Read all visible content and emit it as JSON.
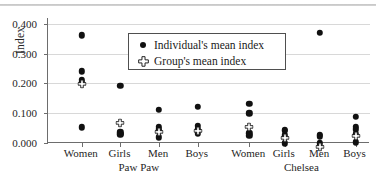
{
  "figure": {
    "y_axis_label": "Index",
    "y_ticks": [
      "0.400",
      "0.300",
      "0.200",
      "0.100",
      "0.000"
    ],
    "legend": {
      "items": [
        {
          "label": "Individual's mean index",
          "marker": "filled-circle-icon"
        },
        {
          "label": "Group's mean index",
          "marker": "open-cross-icon"
        }
      ]
    },
    "group_labels": [
      "Paw Paw",
      "Chelsea"
    ],
    "category_labels": [
      "Women",
      "Girls",
      "Men",
      "Boys",
      "Women",
      "Girls",
      "Men",
      "Boys"
    ],
    "top_rule_text": ""
  },
  "chart_data": {
    "type": "scatter",
    "title": "",
    "xlabel": "",
    "ylabel": "Index",
    "ylim": [
      0.0,
      0.42
    ],
    "yticks": [
      0.0,
      0.1,
      0.2,
      0.3,
      0.4
    ],
    "grid": true,
    "legend_position": "upper-center",
    "groups": [
      "Paw Paw",
      "Chelsea"
    ],
    "categories": [
      "Women",
      "Girls",
      "Men",
      "Boys",
      "Women",
      "Girls",
      "Men",
      "Boys"
    ],
    "series": [
      {
        "name": "Individual's mean index",
        "marker": "filled-circle",
        "points": [
          {
            "category": "Women",
            "group": "Paw Paw",
            "values": [
              0.362,
              0.241,
              0.213,
              0.206,
              0.053
            ]
          },
          {
            "category": "Girls",
            "group": "Paw Paw",
            "values": [
              0.193,
              0.036,
              0.031,
              0.028
            ]
          },
          {
            "category": "Men",
            "group": "Paw Paw",
            "values": [
              0.112,
              0.055,
              0.046,
              0.042,
              0.019
            ]
          },
          {
            "category": "Boys",
            "group": "Paw Paw",
            "values": [
              0.122,
              0.058,
              0.048,
              0.04,
              0.031
            ]
          },
          {
            "category": "Women",
            "group": "Chelsea",
            "values": [
              0.131,
              0.1,
              0.033,
              0.025
            ]
          },
          {
            "category": "Girls",
            "group": "Chelsea",
            "values": [
              0.044,
              0.04,
              0.026,
              -0.001
            ]
          },
          {
            "category": "Men",
            "group": "Chelsea",
            "values": [
              0.37,
              0.028,
              0.022,
              -0.001
            ]
          },
          {
            "category": "Boys",
            "group": "Chelsea",
            "values": [
              0.087,
              0.055,
              0.046,
              0.03,
              0.002
            ]
          }
        ]
      },
      {
        "name": "Group's mean index",
        "marker": "open-cross",
        "points": [
          {
            "category": "Women",
            "group": "Paw Paw",
            "value": 0.215
          },
          {
            "category": "Girls",
            "group": "Paw Paw",
            "value": 0.083
          },
          {
            "category": "Men",
            "group": "Paw Paw",
            "value": 0.055
          },
          {
            "category": "Boys",
            "group": "Paw Paw",
            "value": 0.057
          },
          {
            "category": "Women",
            "group": "Chelsea",
            "value": 0.072
          },
          {
            "category": "Girls",
            "group": "Chelsea",
            "value": 0.032
          },
          {
            "category": "Men",
            "group": "Chelsea",
            "value": 0.004
          },
          {
            "category": "Boys",
            "group": "Chelsea",
            "value": 0.039
          }
        ]
      }
    ]
  }
}
